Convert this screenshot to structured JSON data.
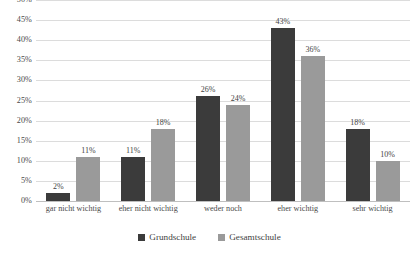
{
  "chart_data": {
    "type": "bar",
    "title": "",
    "subtitle": "",
    "xlabel": "",
    "ylabel": "",
    "ylim": [
      0,
      50
    ],
    "ytick_step": 5,
    "ytick_labels": [
      "50%",
      "45%",
      "40%",
      "35%",
      "30%",
      "25%",
      "20%",
      "15%",
      "10%",
      "5%",
      "0%"
    ],
    "grid": true,
    "legend_position": "bottom",
    "categories": [
      "gar nicht wichtig",
      "eher nicht wichtig",
      "weder noch",
      "eher wichtig",
      "sehr wichtig"
    ],
    "series": [
      {
        "name": "Grundschule",
        "color": "#3b3b3b",
        "values": [
          2,
          11,
          26,
          43,
          18
        ],
        "labels": [
          "2%",
          "11%",
          "26%",
          "43%",
          "18%"
        ]
      },
      {
        "name": "Gesamtschule",
        "color": "#9a9a9a",
        "values": [
          11,
          18,
          24,
          36,
          10
        ],
        "labels": [
          "11%",
          "18%",
          "24%",
          "36%",
          "10%"
        ]
      }
    ]
  },
  "style": {
    "background": "#ffffff",
    "gridline_color": "#dcdcdc",
    "baseline_color": "#bfbfbf",
    "text_color": "#3f3f3f"
  }
}
